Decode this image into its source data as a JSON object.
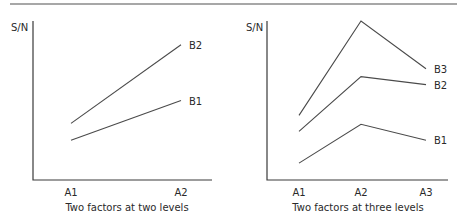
{
  "chart_data": [
    {
      "type": "line",
      "title": "Two factors at two levels",
      "xlabel": "",
      "ylabel": "S/N",
      "categories": [
        "A1",
        "A2"
      ],
      "series": [
        {
          "name": "B1",
          "values": [
            40,
            80
          ]
        },
        {
          "name": "B2",
          "values": [
            57,
            136
          ]
        }
      ],
      "ylim": [
        0,
        160
      ],
      "grid": false,
      "legend": "inline labels at right end of each line",
      "layout": {
        "origin_x": 33,
        "origin_y": 180,
        "axis_top": 21,
        "axis_right": 212,
        "x_positions": [
          71,
          181
        ],
        "label_x": 189,
        "ylabel_x": 11,
        "ylabel_y": 31,
        "tick_label_y": 196,
        "caption_x": 127,
        "caption_y": 211
      }
    },
    {
      "type": "line",
      "title": "Two factors at three levels",
      "xlabel": "",
      "ylabel": "S/N",
      "categories": [
        "A1",
        "A2",
        "A3"
      ],
      "series": [
        {
          "name": "B1",
          "values": [
            17,
            56,
            40
          ]
        },
        {
          "name": "B2",
          "values": [
            49,
            104,
            96
          ]
        },
        {
          "name": "B3",
          "values": [
            65,
            160,
            112
          ]
        }
      ],
      "ylim": [
        0,
        160
      ],
      "grid": false,
      "legend": "inline labels at right end of each line",
      "layout": {
        "origin_x": 267,
        "origin_y": 180,
        "axis_top": 21,
        "axis_right": 448,
        "x_positions": [
          299,
          361,
          426
        ],
        "label_x": 434,
        "ylabel_x": 246,
        "ylabel_y": 31,
        "tick_label_y": 196,
        "caption_x": 358,
        "caption_y": 211
      }
    }
  ],
  "header_rule": {
    "y": 4,
    "x1": 10,
    "x2": 457,
    "color": "#8a8a8a"
  }
}
